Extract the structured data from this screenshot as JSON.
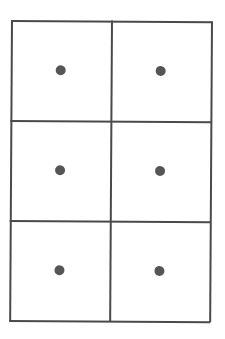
{
  "diagram": {
    "type": "grid",
    "rows": 3,
    "columns": 2,
    "line_color": "#4a4a4a",
    "dot_color": "#555555",
    "cells": [
      {
        "row": 0,
        "col": 0,
        "has_dot": true
      },
      {
        "row": 0,
        "col": 1,
        "has_dot": true
      },
      {
        "row": 1,
        "col": 0,
        "has_dot": true
      },
      {
        "row": 1,
        "col": 1,
        "has_dot": true
      },
      {
        "row": 2,
        "col": 0,
        "has_dot": true
      },
      {
        "row": 2,
        "col": 1,
        "has_dot": true
      }
    ]
  }
}
